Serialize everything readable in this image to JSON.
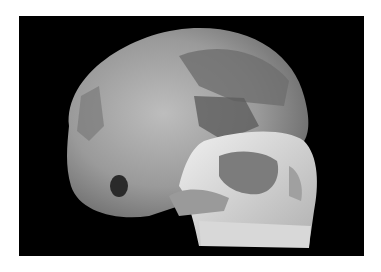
{
  "image": {
    "subject": "human skull, three-quarter right lateral view",
    "background_color": "#000000",
    "page_color": "#ffffff",
    "tones": {
      "cranium_light": "#b8b8b8",
      "cranium_mid": "#8f8f8f",
      "cranium_dark": "#5e5e5e",
      "face_highlight": "#e8e8e8"
    }
  }
}
